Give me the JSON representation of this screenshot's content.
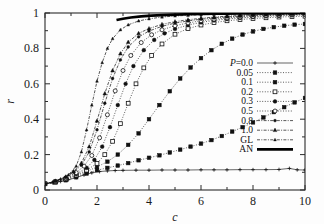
{
  "chart_data": {
    "type": "line",
    "title": "",
    "xlabel": "c",
    "ylabel": "r",
    "xlim": [
      0,
      10
    ],
    "ylim": [
      0,
      1
    ],
    "xticks": [
      0,
      2,
      4,
      6,
      8,
      10
    ],
    "xtick_labels": [
      "0",
      "2",
      "4",
      "6",
      "8",
      "10"
    ],
    "yticks": [
      0,
      0.2,
      0.4,
      0.6,
      0.8,
      1
    ],
    "ytick_labels": [
      "0",
      "0.2",
      "0.4",
      "0.6",
      "0.8",
      "1"
    ],
    "grid": false,
    "legend_position": "right-center",
    "legend_title_prefix": "P=",
    "series": [
      {
        "name": "P=0.0",
        "label": "P=0.0",
        "marker": "plus",
        "linestyle": "solid-thin",
        "color": "#222222",
        "x": [
          0,
          0.3,
          0.6,
          0.9,
          1.2,
          1.5,
          1.8,
          2.1,
          2.4,
          2.7,
          3.0,
          3.5,
          4.0,
          4.5,
          5.0,
          5.5,
          6.0,
          6.5,
          7.0,
          7.5,
          8.0,
          8.5,
          9.0,
          9.4,
          9.7,
          10.0
        ],
        "y": [
          0.035,
          0.04,
          0.048,
          0.058,
          0.07,
          0.085,
          0.097,
          0.104,
          0.108,
          0.11,
          0.111,
          0.112,
          0.112,
          0.113,
          0.113,
          0.113,
          0.114,
          0.114,
          0.114,
          0.115,
          0.115,
          0.115,
          0.116,
          0.122,
          0.114,
          0.113
        ]
      },
      {
        "name": "P=0.05",
        "label": "0.05",
        "marker": "square-filled",
        "linestyle": "dotted",
        "color": "#1a1a1a",
        "x": [
          0,
          0.4,
          0.8,
          1.2,
          1.6,
          2.0,
          2.4,
          2.8,
          3.2,
          3.6,
          4.0,
          4.4,
          4.8,
          5.2,
          5.6,
          6.0,
          6.4,
          6.8,
          7.2,
          7.6,
          8.0,
          8.4,
          8.8,
          9.2,
          9.6,
          10.0
        ],
        "y": [
          0.035,
          0.043,
          0.055,
          0.072,
          0.093,
          0.112,
          0.125,
          0.138,
          0.152,
          0.168,
          0.182,
          0.196,
          0.212,
          0.228,
          0.245,
          0.262,
          0.282,
          0.305,
          0.33,
          0.355,
          0.382,
          0.41,
          0.44,
          0.468,
          0.495,
          0.52
        ]
      },
      {
        "name": "P=0.1",
        "label": "0.1",
        "marker": "square-filled",
        "linestyle": "dotted",
        "color": "#1a1a1a",
        "x": [
          0,
          0.4,
          0.8,
          1.2,
          1.6,
          2.0,
          2.4,
          2.8,
          3.2,
          3.6,
          4.0,
          4.4,
          4.8,
          5.2,
          5.6,
          6.0,
          6.4,
          6.8,
          7.2,
          7.6,
          8.0,
          8.4,
          8.8,
          9.2,
          9.6,
          10.0
        ],
        "y": [
          0.035,
          0.045,
          0.06,
          0.08,
          0.105,
          0.13,
          0.16,
          0.2,
          0.255,
          0.32,
          0.4,
          0.48,
          0.558,
          0.63,
          0.692,
          0.745,
          0.79,
          0.826,
          0.855,
          0.878,
          0.896,
          0.91,
          0.92,
          0.928,
          0.934,
          0.938
        ]
      },
      {
        "name": "P=0.2",
        "label": "0.2",
        "marker": "square-open",
        "linestyle": "dotted",
        "color": "#1a1a1a",
        "x": [
          0,
          0.4,
          0.8,
          1.2,
          1.6,
          2.0,
          2.3,
          2.6,
          2.9,
          3.2,
          3.5,
          3.8,
          4.1,
          4.5,
          5.0,
          5.5,
          6.0,
          6.5,
          7.0,
          7.5,
          8.0,
          8.5,
          9.0,
          9.5,
          10.0
        ],
        "y": [
          0.035,
          0.046,
          0.062,
          0.084,
          0.112,
          0.15,
          0.2,
          0.275,
          0.375,
          0.49,
          0.6,
          0.69,
          0.76,
          0.825,
          0.88,
          0.912,
          0.932,
          0.946,
          0.956,
          0.963,
          0.969,
          0.973,
          0.977,
          0.98,
          0.982
        ]
      },
      {
        "name": "P=0.3",
        "label": "0.3",
        "marker": "circle-filled",
        "linestyle": "dotted",
        "color": "#111111",
        "x": [
          0,
          0.4,
          0.8,
          1.2,
          1.6,
          1.9,
          2.2,
          2.5,
          2.8,
          3.1,
          3.4,
          3.8,
          4.2,
          4.6,
          5.0,
          5.5,
          6.0,
          6.5,
          7.0,
          7.5,
          8.0,
          8.5,
          9.0,
          9.5,
          10.0
        ],
        "y": [
          0.035,
          0.047,
          0.065,
          0.09,
          0.125,
          0.17,
          0.245,
          0.355,
          0.48,
          0.6,
          0.7,
          0.79,
          0.848,
          0.885,
          0.91,
          0.932,
          0.947,
          0.958,
          0.966,
          0.972,
          0.977,
          0.981,
          0.984,
          0.987,
          0.989
        ]
      },
      {
        "name": "P=0.5",
        "label": "0.5",
        "marker": "circle-open",
        "linestyle": "dotted",
        "color": "#111111",
        "x": [
          0,
          0.4,
          0.8,
          1.2,
          1.5,
          1.8,
          2.1,
          2.4,
          2.7,
          3.0,
          3.3,
          3.7,
          4.1,
          4.5,
          5.0,
          5.5,
          6.0,
          6.5,
          7.0,
          7.5,
          8.0,
          8.5,
          9.0,
          9.5,
          10.0
        ],
        "y": [
          0.035,
          0.048,
          0.068,
          0.098,
          0.135,
          0.195,
          0.295,
          0.425,
          0.56,
          0.675,
          0.76,
          0.833,
          0.877,
          0.905,
          0.928,
          0.944,
          0.956,
          0.965,
          0.972,
          0.977,
          0.981,
          0.985,
          0.988,
          0.99,
          0.992
        ]
      },
      {
        "name": "P=0.8",
        "label": "0.8",
        "marker": "circle-filled-small",
        "linestyle": "dash-dot",
        "color": "#111111",
        "x": [
          0,
          0.4,
          0.8,
          1.1,
          1.4,
          1.7,
          2.0,
          2.3,
          2.6,
          2.9,
          3.2,
          3.6,
          4.0,
          4.5,
          5.0,
          5.5,
          6.0,
          6.5,
          7.0,
          7.5,
          8.0,
          8.5,
          9.0,
          9.5,
          10.0
        ],
        "y": [
          0.035,
          0.05,
          0.072,
          0.1,
          0.14,
          0.215,
          0.34,
          0.49,
          0.63,
          0.735,
          0.808,
          0.865,
          0.898,
          0.925,
          0.943,
          0.955,
          0.965,
          0.972,
          0.978,
          0.982,
          0.986,
          0.989,
          0.991,
          0.993,
          0.995
        ]
      },
      {
        "name": "P=1.0",
        "label": "1.0",
        "marker": "triangle-filled",
        "linestyle": "dash-dot",
        "color": "#111111",
        "x": [
          0,
          0.4,
          0.8,
          1.1,
          1.4,
          1.7,
          2.0,
          2.3,
          2.6,
          2.9,
          3.2,
          3.6,
          4.0,
          4.5,
          5.0,
          5.5,
          6.0,
          6.5,
          7.0,
          7.5,
          8.0,
          8.5,
          9.0,
          9.5,
          10.0
        ],
        "y": [
          0.035,
          0.051,
          0.075,
          0.105,
          0.152,
          0.245,
          0.39,
          0.545,
          0.675,
          0.77,
          0.835,
          0.885,
          0.912,
          0.936,
          0.951,
          0.962,
          0.97,
          0.977,
          0.982,
          0.986,
          0.989,
          0.992,
          0.994,
          0.996,
          0.997
        ]
      },
      {
        "name": "GL",
        "label": "GL",
        "marker": "triangle-filled-small",
        "linestyle": "dash-dot",
        "color": "#111111",
        "x": [
          0,
          0.3,
          0.6,
          0.9,
          1.2,
          1.4,
          1.6,
          1.8,
          2.0,
          2.2,
          2.4,
          2.6,
          2.9,
          3.2,
          3.6,
          4.0,
          4.5,
          5.0,
          5.5,
          6.0,
          6.5,
          7.0,
          7.5,
          8.0,
          8.5,
          9.0,
          9.5,
          10.0
        ],
        "y": [
          0.035,
          0.046,
          0.062,
          0.085,
          0.135,
          0.215,
          0.34,
          0.48,
          0.615,
          0.72,
          0.8,
          0.855,
          0.905,
          0.933,
          0.955,
          0.967,
          0.977,
          0.983,
          0.987,
          0.99,
          0.992,
          0.994,
          0.995,
          0.996,
          0.997,
          0.998,
          0.999,
          0.999
        ]
      },
      {
        "name": "AN",
        "label": "AN",
        "marker": "none",
        "linestyle": "solid-thick",
        "color": "#000000",
        "x": [
          2.75,
          3.0,
          3.3,
          3.7,
          4.1,
          4.5,
          5.0,
          5.5,
          6.0,
          6.5,
          7.0,
          7.5,
          8.0,
          8.5,
          9.0,
          9.5,
          10.0
        ],
        "y": [
          0.96,
          0.968,
          0.975,
          0.981,
          0.985,
          0.988,
          0.991,
          0.993,
          0.994,
          0.996,
          0.996,
          0.997,
          0.998,
          0.998,
          0.999,
          0.999,
          1.0
        ]
      }
    ]
  }
}
